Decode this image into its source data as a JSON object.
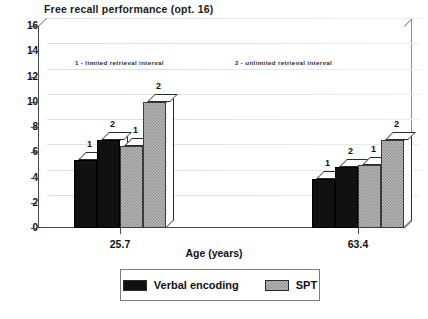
{
  "chart_data": {
    "type": "bar",
    "title": "Free recall performance (opt. 16)",
    "xlabel": "Age (years)",
    "ylabel": "",
    "ylim": [
      0,
      16
    ],
    "ytick_step": 2,
    "yticks": [
      "0",
      "2",
      "4",
      "6",
      "8",
      "10",
      "12",
      "14",
      "16"
    ],
    "categories": [
      "25.7",
      "63.4"
    ],
    "grid": true,
    "legend_position": "bottom",
    "style": "3d-bar",
    "series": [
      {
        "name": "Verbal encoding",
        "condition": "1",
        "fill": "black",
        "values": [
          5.4,
          3.9
        ]
      },
      {
        "name": "Verbal encoding",
        "condition": "2",
        "fill": "black",
        "values": [
          7.0,
          4.8
        ]
      },
      {
        "name": "SPT",
        "condition": "1",
        "fill": "hatched-gray",
        "values": [
          6.5,
          5.0
        ]
      },
      {
        "name": "SPT",
        "condition": "2",
        "fill": "hatched-gray",
        "values": [
          10.0,
          7.0
        ]
      }
    ],
    "bar_labels": [
      [
        "1",
        "2",
        "1",
        "2"
      ],
      [
        "1",
        "2",
        "1",
        "2"
      ]
    ],
    "annotations": [
      "1 - limited retrieval interval",
      "2 - unlimited retrieval interval"
    ],
    "legend": [
      {
        "label": "Verbal encoding",
        "swatch": "black"
      },
      {
        "label": "SPT",
        "swatch": "hatched-gray"
      }
    ],
    "colors": {
      "verbal_encoding": "#111111",
      "spt": "#b9b9b9",
      "axis": "#4a4a4a",
      "grid": "#e2e2e2",
      "background": "#ffffff"
    }
  }
}
